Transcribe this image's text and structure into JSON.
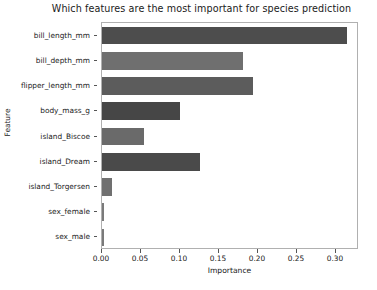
{
  "chart_data": {
    "type": "bar",
    "orientation": "horizontal",
    "title": "Which features are the most important for species prediction",
    "xlabel": "Importance",
    "ylabel": "Feature",
    "categories": [
      "bill_length_mm",
      "bill_depth_mm",
      "flipper_length_mm",
      "body_mass_g",
      "island_Biscoe",
      "island_Dream",
      "island_Torgersen",
      "sex_female",
      "sex_male"
    ],
    "values": [
      0.314,
      0.181,
      0.194,
      0.1,
      0.054,
      0.126,
      0.013,
      0.002,
      0.002
    ],
    "bar_colors": [
      "#4d4d4d",
      "#6f6f6f",
      "#5c5c5c",
      "#464646",
      "#6a6a6a",
      "#4a4a4a",
      "#707070",
      "#7a7a7a",
      "#7a7a7a"
    ],
    "xlim": [
      0.0,
      0.3295
    ],
    "xticks": [
      0.0,
      0.05,
      0.1,
      0.15,
      0.2,
      0.25,
      0.3
    ],
    "xtick_labels": [
      "0.00",
      "0.05",
      "0.10",
      "0.15",
      "0.20",
      "0.25",
      "0.30"
    ],
    "grid": false,
    "legend": null
  }
}
